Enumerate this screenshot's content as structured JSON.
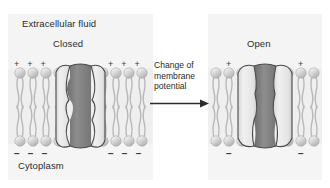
{
  "figure": {
    "background_color": "#ffffff",
    "panel_color": "#f2f2f2"
  },
  "labels": {
    "extracellular": "Extracellular fluid",
    "cytoplasm": "Cytoplasm"
  },
  "panels": [
    {
      "id": "closed",
      "state_label": "Closed",
      "extracellular_charges": {
        "left": [
          "+",
          "+",
          "+"
        ],
        "right": [
          "+",
          "+",
          "+"
        ]
      },
      "cytoplasmic_charges": {
        "left": [
          "−",
          "−",
          "−"
        ],
        "right": [
          "−",
          "−",
          "−"
        ]
      }
    },
    {
      "id": "open",
      "state_label": "Open",
      "extracellular_charges": {
        "left": [
          "+"
        ],
        "right": [
          "+"
        ]
      },
      "cytoplasmic_charges": {
        "left": [
          "−"
        ],
        "right": [
          "−"
        ]
      }
    }
  ],
  "caption": {
    "line1": "Change of",
    "line2": "membrane",
    "line3": "potential"
  },
  "arrow": {
    "direction": "right",
    "name": "transition-arrow"
  },
  "colors": {
    "protein_light": "#e4e4e4",
    "protein_dark": "#8a8a8a",
    "outline": "#4a4a4a",
    "lipid_head": "#d6d6d6",
    "lipid_tail": "#b4b4b4",
    "text": "#2b2b2b"
  }
}
